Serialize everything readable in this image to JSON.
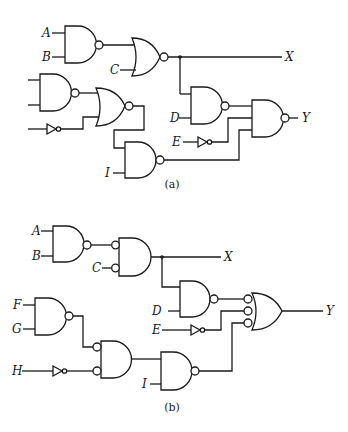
{
  "diagrams": [
    {
      "id": "a",
      "caption": "(a)",
      "inputs": [
        "A",
        "B",
        "C",
        "D",
        "E",
        "I"
      ],
      "outputs": [
        "X",
        "Y"
      ],
      "gates": [
        {
          "name": "nand-ab",
          "type": "NAND",
          "inputs": [
            "A",
            "B"
          ]
        },
        {
          "name": "nor-c",
          "type": "NOR",
          "inputs": [
            "nand-ab",
            "C"
          ],
          "output": "X"
        },
        {
          "name": "nand-left",
          "type": "NAND",
          "inputs": [
            "unlabeled",
            "unlabeled"
          ]
        },
        {
          "name": "inv-left",
          "type": "NOT",
          "inputs": [
            "unlabeled"
          ]
        },
        {
          "name": "nor-left",
          "type": "NOR",
          "inputs": [
            "nand-left",
            "inv-left"
          ]
        },
        {
          "name": "nand-i",
          "type": "NAND",
          "inputs": [
            "nor-left",
            "I"
          ]
        },
        {
          "name": "nand-d",
          "type": "NAND",
          "inputs": [
            "X",
            "D"
          ]
        },
        {
          "name": "inv-e",
          "type": "NOT",
          "inputs": [
            "E"
          ]
        },
        {
          "name": "nand-y",
          "type": "NAND",
          "inputs": [
            "nand-d",
            "inv-e",
            "nand-i"
          ],
          "output": "Y"
        }
      ]
    },
    {
      "id": "b",
      "caption": "(b)",
      "inputs": [
        "A",
        "B",
        "C",
        "D",
        "E",
        "F",
        "G",
        "H",
        "I"
      ],
      "outputs": [
        "X",
        "Y"
      ],
      "gates": [
        {
          "name": "nand-ab",
          "type": "NAND",
          "inputs": [
            "A",
            "B"
          ]
        },
        {
          "name": "and-bubbled-c",
          "type": "AND (inverted inputs)",
          "inputs": [
            "nand-ab",
            "C"
          ],
          "output": "X"
        },
        {
          "name": "nand-d",
          "type": "NAND",
          "inputs": [
            "X",
            "D"
          ]
        },
        {
          "name": "inv-e",
          "type": "NOT",
          "inputs": [
            "E"
          ]
        },
        {
          "name": "nand-fg",
          "type": "NAND",
          "inputs": [
            "F",
            "G"
          ]
        },
        {
          "name": "inv-h",
          "type": "NOT",
          "inputs": [
            "H"
          ]
        },
        {
          "name": "and-bubbled-fgh",
          "type": "AND (inverted inputs)",
          "inputs": [
            "nand-fg",
            "inv-h"
          ]
        },
        {
          "name": "nand-i",
          "type": "NAND",
          "inputs": [
            "and-bubbled-fgh",
            "I"
          ]
        },
        {
          "name": "or-bubbled-y",
          "type": "OR (inverted inputs)",
          "inputs": [
            "nand-d",
            "inv-e",
            "nand-i"
          ],
          "output": "Y"
        }
      ]
    }
  ],
  "labels": {
    "a": {
      "A": "A",
      "B": "B",
      "C": "C",
      "D": "D",
      "E": "E",
      "I": "I",
      "X": "X",
      "Y": "Y"
    },
    "b": {
      "A": "A",
      "B": "B",
      "C": "C",
      "D": "D",
      "E": "E",
      "F": "F",
      "G": "G",
      "H": "H",
      "I": "I",
      "X": "X",
      "Y": "Y"
    }
  },
  "captions": {
    "a": "(a)",
    "b": "(b)"
  }
}
